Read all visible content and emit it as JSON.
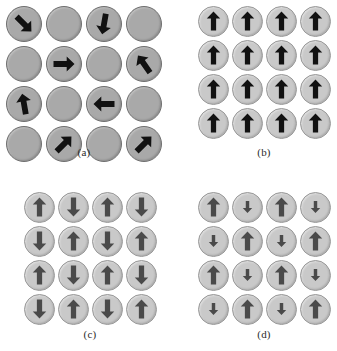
{
  "figure": {
    "background_color": "#ffffff",
    "panels": [
      {
        "id": "a",
        "caption": "(a)",
        "name": "paramagnetic",
        "disc_color": "#a9a9a9",
        "disc_border_color": "#6f6f6f",
        "arrow_color": "#111111",
        "rows": 4,
        "cols": 4,
        "cells": [
          {
            "arrow": true,
            "angle": 135,
            "size": "large"
          },
          {
            "arrow": false,
            "angle": null,
            "size": null
          },
          {
            "arrow": true,
            "angle": 190,
            "size": "large"
          },
          {
            "arrow": false,
            "angle": null,
            "size": null
          },
          {
            "arrow": false,
            "angle": null,
            "size": null
          },
          {
            "arrow": true,
            "angle": 90,
            "size": "large"
          },
          {
            "arrow": false,
            "angle": null,
            "size": null
          },
          {
            "arrow": true,
            "angle": -35,
            "size": "large"
          },
          {
            "arrow": true,
            "angle": -10,
            "size": "large"
          },
          {
            "arrow": false,
            "angle": null,
            "size": null
          },
          {
            "arrow": true,
            "angle": 270,
            "size": "large"
          },
          {
            "arrow": false,
            "angle": null,
            "size": null
          },
          {
            "arrow": false,
            "angle": null,
            "size": null
          },
          {
            "arrow": true,
            "angle": 45,
            "size": "large"
          },
          {
            "arrow": false,
            "angle": null,
            "size": null
          },
          {
            "arrow": true,
            "angle": 45,
            "size": "large"
          }
        ]
      },
      {
        "id": "b",
        "caption": "(b)",
        "name": "ferromagnetic",
        "disc_color": "#c9c9c9",
        "disc_border_color": "#9a9a9a",
        "arrow_color": "#111111",
        "rows": 4,
        "cols": 4,
        "cells": [
          {
            "arrow": true,
            "angle": 0,
            "size": "large"
          },
          {
            "arrow": true,
            "angle": 0,
            "size": "large"
          },
          {
            "arrow": true,
            "angle": 0,
            "size": "large"
          },
          {
            "arrow": true,
            "angle": 0,
            "size": "large"
          },
          {
            "arrow": true,
            "angle": 0,
            "size": "large"
          },
          {
            "arrow": true,
            "angle": 0,
            "size": "large"
          },
          {
            "arrow": true,
            "angle": 0,
            "size": "large"
          },
          {
            "arrow": true,
            "angle": 0,
            "size": "large"
          },
          {
            "arrow": true,
            "angle": 0,
            "size": "large"
          },
          {
            "arrow": true,
            "angle": 0,
            "size": "large"
          },
          {
            "arrow": true,
            "angle": 0,
            "size": "large"
          },
          {
            "arrow": true,
            "angle": 0,
            "size": "large"
          },
          {
            "arrow": true,
            "angle": 0,
            "size": "large"
          },
          {
            "arrow": true,
            "angle": 0,
            "size": "large"
          },
          {
            "arrow": true,
            "angle": 0,
            "size": "large"
          },
          {
            "arrow": true,
            "angle": 0,
            "size": "large"
          }
        ]
      },
      {
        "id": "c",
        "caption": "(c)",
        "name": "antiferromagnetic",
        "disc_color": "#c9c9c9",
        "disc_border_color": "#9a9a9a",
        "arrow_color": "#4a4a4a",
        "rows": 4,
        "cols": 4,
        "cells": [
          {
            "arrow": true,
            "angle": 0,
            "size": "large"
          },
          {
            "arrow": true,
            "angle": 180,
            "size": "large"
          },
          {
            "arrow": true,
            "angle": 0,
            "size": "large"
          },
          {
            "arrow": true,
            "angle": 180,
            "size": "large"
          },
          {
            "arrow": true,
            "angle": 180,
            "size": "large"
          },
          {
            "arrow": true,
            "angle": 0,
            "size": "large"
          },
          {
            "arrow": true,
            "angle": 180,
            "size": "large"
          },
          {
            "arrow": true,
            "angle": 0,
            "size": "large"
          },
          {
            "arrow": true,
            "angle": 0,
            "size": "large"
          },
          {
            "arrow": true,
            "angle": 180,
            "size": "large"
          },
          {
            "arrow": true,
            "angle": 0,
            "size": "large"
          },
          {
            "arrow": true,
            "angle": 180,
            "size": "large"
          },
          {
            "arrow": true,
            "angle": 180,
            "size": "large"
          },
          {
            "arrow": true,
            "angle": 0,
            "size": "large"
          },
          {
            "arrow": true,
            "angle": 180,
            "size": "large"
          },
          {
            "arrow": true,
            "angle": 0,
            "size": "large"
          }
        ]
      },
      {
        "id": "d",
        "caption": "(d)",
        "name": "ferrimagnetic",
        "disc_color": "#c9c9c9",
        "disc_border_color": "#9a9a9a",
        "arrow_color": "#4a4a4a",
        "rows": 4,
        "cols": 4,
        "cells": [
          {
            "arrow": true,
            "angle": 0,
            "size": "large"
          },
          {
            "arrow": true,
            "angle": 180,
            "size": "small"
          },
          {
            "arrow": true,
            "angle": 0,
            "size": "large"
          },
          {
            "arrow": true,
            "angle": 180,
            "size": "small"
          },
          {
            "arrow": true,
            "angle": 180,
            "size": "small"
          },
          {
            "arrow": true,
            "angle": 0,
            "size": "large"
          },
          {
            "arrow": true,
            "angle": 180,
            "size": "small"
          },
          {
            "arrow": true,
            "angle": 0,
            "size": "large"
          },
          {
            "arrow": true,
            "angle": 0,
            "size": "large"
          },
          {
            "arrow": true,
            "angle": 180,
            "size": "small"
          },
          {
            "arrow": true,
            "angle": 0,
            "size": "large"
          },
          {
            "arrow": true,
            "angle": 180,
            "size": "small"
          },
          {
            "arrow": true,
            "angle": 180,
            "size": "small"
          },
          {
            "arrow": true,
            "angle": 0,
            "size": "large"
          },
          {
            "arrow": true,
            "angle": 180,
            "size": "small"
          },
          {
            "arrow": true,
            "angle": 0,
            "size": "large"
          }
        ]
      }
    ]
  }
}
